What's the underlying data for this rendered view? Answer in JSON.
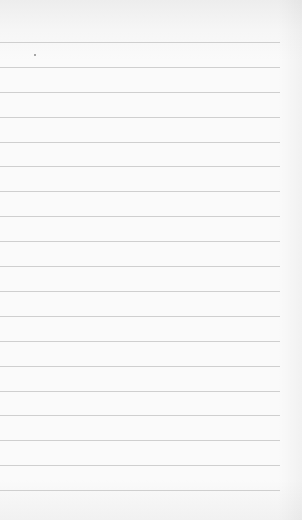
{
  "page": {
    "type": "lined-paper",
    "background_color": "#fafafa",
    "rule_color": "#cfcfcf",
    "rule_count": 19,
    "rules": [
      {
        "y": 42
      },
      {
        "y": 67
      },
      {
        "y": 92
      },
      {
        "y": 117
      },
      {
        "y": 142
      },
      {
        "y": 166
      },
      {
        "y": 191
      },
      {
        "y": 216
      },
      {
        "y": 241
      },
      {
        "y": 266
      },
      {
        "y": 291
      },
      {
        "y": 316
      },
      {
        "y": 341
      },
      {
        "y": 366
      },
      {
        "y": 391
      },
      {
        "y": 415
      },
      {
        "y": 440
      },
      {
        "y": 465
      },
      {
        "y": 490
      }
    ]
  }
}
